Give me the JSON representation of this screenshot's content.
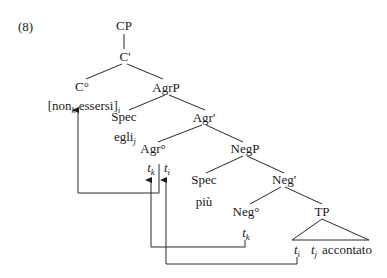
{
  "example_number": "(8)",
  "nodes": {
    "cp": "CP",
    "c_bar": "C'",
    "c_head": "C°",
    "c_content_open": "[non",
    "c_content_k": "k",
    "c_content_mid": " essersi]",
    "c_content_i": "i",
    "agrp": "AgrP",
    "spec_agr": "Spec",
    "egli": "egli",
    "egli_j": "j",
    "agr_bar": "Agr'",
    "agr_head": "Agr°",
    "t": "t",
    "k": "k",
    "i": "i",
    "j": "j",
    "negp": "NegP",
    "spec_neg": "Spec",
    "piu": "più",
    "neg_bar": "Neg'",
    "neg_head": "Neg°",
    "tp": "TP",
    "accontato": "accontato"
  },
  "colors": {
    "line": "#2a2a2a",
    "text": "#1a1a1a",
    "background": "#ffffff"
  }
}
